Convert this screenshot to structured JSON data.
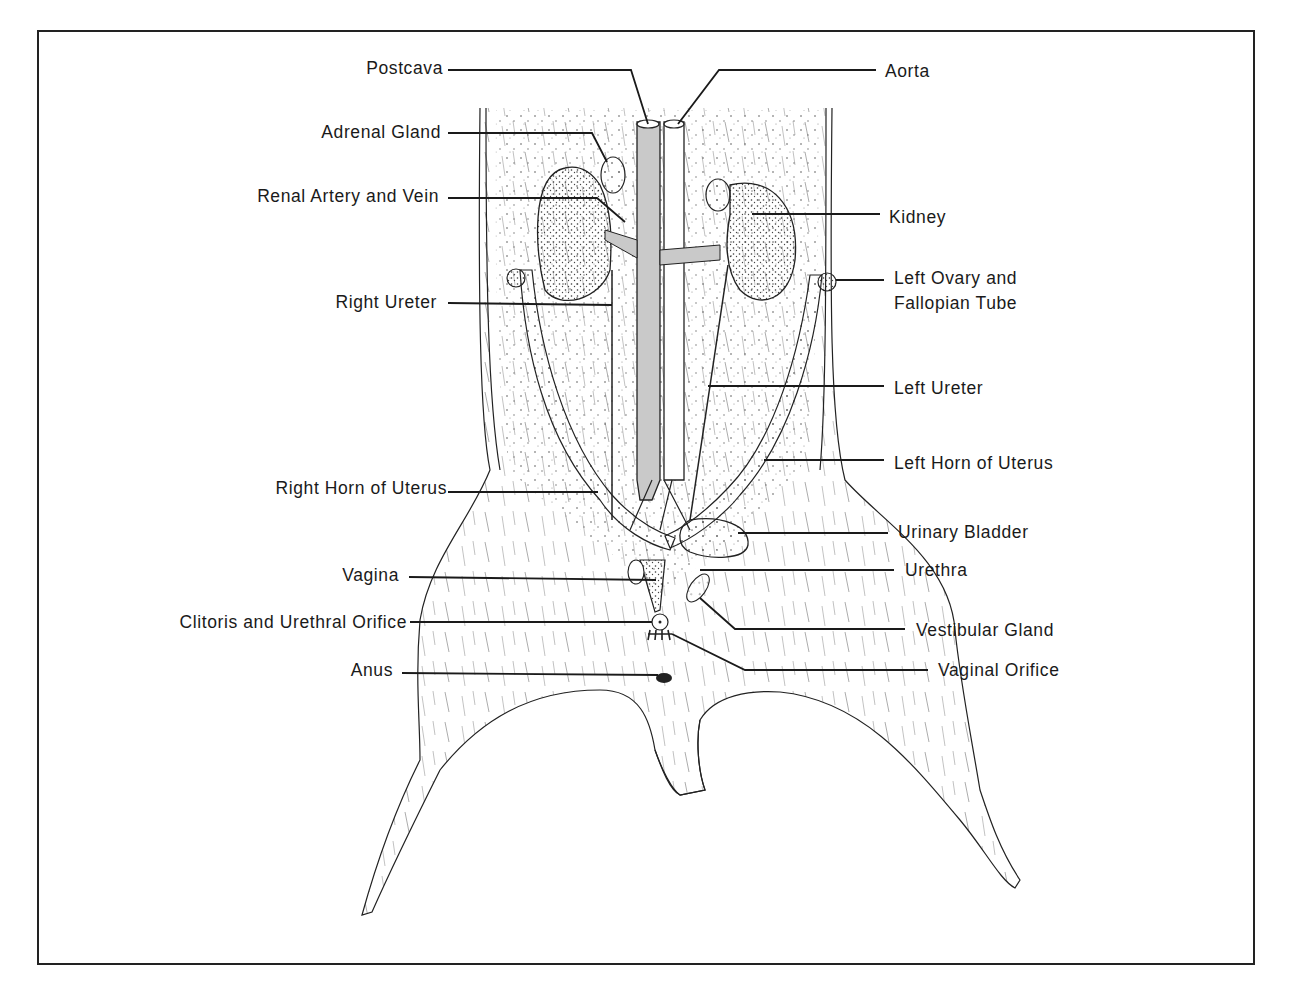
{
  "figure": {
    "colors": {
      "ink": "#1a1a1a",
      "vessel_fill": "#c9c9c9",
      "paper": "#ffffff"
    }
  },
  "labels": {
    "left": [
      {
        "id": "postcava",
        "text": "Postcava"
      },
      {
        "id": "adrenal_gland",
        "text": "Adrenal Gland"
      },
      {
        "id": "renal_artery_vein",
        "text": "Renal Artery and Vein"
      },
      {
        "id": "right_ureter",
        "text": "Right Ureter"
      },
      {
        "id": "right_horn_uterus",
        "text": "Right Horn of Uterus"
      },
      {
        "id": "vagina",
        "text": "Vagina"
      },
      {
        "id": "clitoris_urethral_orifice",
        "text": "Clitoris and Urethral Orifice"
      },
      {
        "id": "anus",
        "text": "Anus"
      }
    ],
    "right": [
      {
        "id": "aorta",
        "text": "Aorta"
      },
      {
        "id": "kidney",
        "text": "Kidney"
      },
      {
        "id": "left_ovary_line1",
        "text": "Left Ovary and"
      },
      {
        "id": "left_ovary_line2",
        "text": "Fallopian Tube"
      },
      {
        "id": "left_ureter",
        "text": "Left Ureter"
      },
      {
        "id": "left_horn_uterus",
        "text": "Left Horn of Uterus"
      },
      {
        "id": "urinary_bladder",
        "text": "Urinary Bladder"
      },
      {
        "id": "urethra",
        "text": "Urethra"
      },
      {
        "id": "vestibular_gland",
        "text": "Vestibular Gland"
      },
      {
        "id": "vaginal_orifice",
        "text": "Vaginal Orifice"
      }
    ]
  }
}
